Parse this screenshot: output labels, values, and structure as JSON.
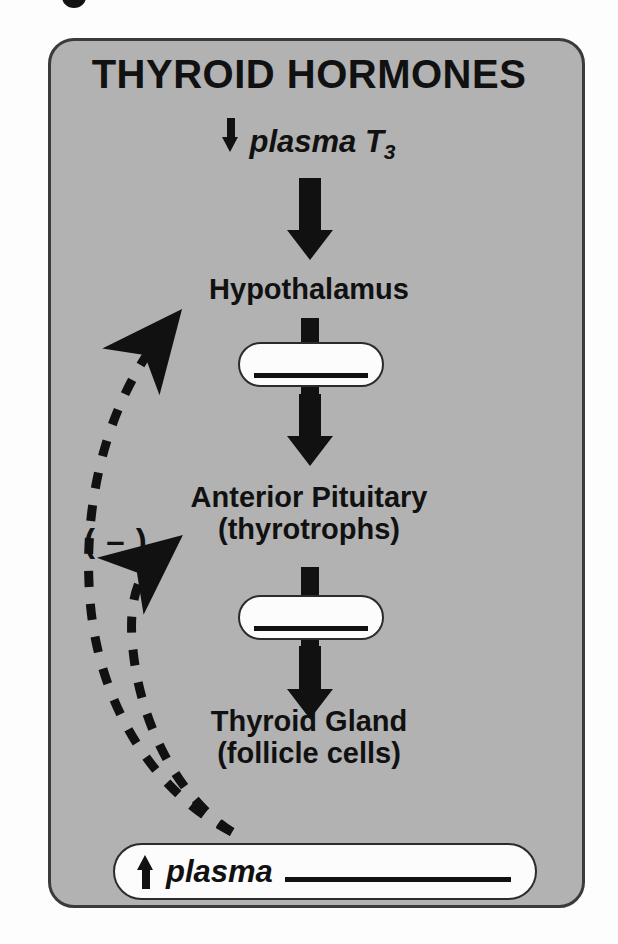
{
  "figure": {
    "title": "THYROID HORMONES",
    "background_color": "#b2b2b2",
    "panel_border_color": "#3b3b3b",
    "ink_color": "#111111",
    "pill_fill_color": "#fcfcfc"
  },
  "stimulus": {
    "arrow_icon": "down-arrow-icon",
    "label": "plasma T",
    "subscript": "3"
  },
  "nodes": {
    "hypothalamus": {
      "label": "Hypothalamus"
    },
    "anterior_pituitary": {
      "line1": "Anterior Pituitary",
      "line2": "(thyrotrophs)"
    },
    "thyroid_gland": {
      "line1": "Thyroid Gland",
      "line2": "(follicle cells)"
    }
  },
  "blanks": {
    "hormone_1": "",
    "hormone_2": "",
    "plasma_output": ""
  },
  "output": {
    "arrow_icon": "up-arrow-icon",
    "label": "plasma"
  },
  "feedback": {
    "sign_label": "( – )",
    "paths": [
      {
        "name": "to-hypothalamus",
        "style": "dashed",
        "arrowhead": true
      },
      {
        "name": "to-anterior-pituitary",
        "style": "dashed",
        "arrowhead": true
      }
    ]
  }
}
